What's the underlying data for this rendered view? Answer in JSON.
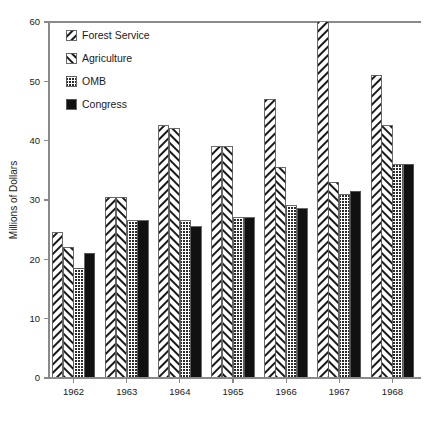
{
  "chart_data": {
    "type": "bar",
    "title": "",
    "subtitle": "",
    "xlabel": "",
    "ylabel": "Millions of Dollars",
    "categories": [
      "1962",
      "1963",
      "1964",
      "1965",
      "1966",
      "1967",
      "1968"
    ],
    "series": [
      {
        "name": "Forest Service",
        "pattern": "diagonal-up-hatch",
        "values": [
          24.5,
          30.5,
          42.5,
          39.0,
          47.0,
          60.5,
          51.0
        ]
      },
      {
        "name": "Agriculture",
        "pattern": "diagonal-down-hatch",
        "values": [
          22.0,
          30.5,
          42.0,
          39.0,
          35.5,
          33.0,
          42.5
        ]
      },
      {
        "name": "OMB",
        "pattern": "stipple-dots",
        "values": [
          18.5,
          26.5,
          26.5,
          27.0,
          29.0,
          31.0,
          36.0
        ]
      },
      {
        "name": "Congress",
        "pattern": "solid-black",
        "values": [
          21.0,
          26.5,
          25.5,
          27.0,
          28.5,
          31.5,
          36.0
        ]
      }
    ],
    "ylim": [
      0,
      60
    ],
    "yticks": [
      0,
      10,
      20,
      30,
      40,
      50,
      60
    ],
    "ytick_labels": [
      "0",
      "10",
      "20",
      "30",
      "40",
      "50",
      "60"
    ],
    "grid": false,
    "legend_position": "upper-left-inside"
  },
  "legend": {
    "entries": [
      {
        "label": "Forest Service",
        "swatch": "diagonal-up-hatch"
      },
      {
        "label": "Agriculture",
        "swatch": "diagonal-down-hatch"
      },
      {
        "label": "OMB",
        "swatch": "stipple-dots"
      },
      {
        "label": "Congress",
        "swatch": "solid-black"
      }
    ]
  },
  "colors": {
    "background": "#ffffff",
    "axis": "#8a8a8a",
    "bar_outline": "#5a5a5a",
    "hatch_ink": "#1a1a1a",
    "solid_fill": "#111111",
    "text": "#1a1a1a"
  },
  "caption": {
    "text": ""
  }
}
